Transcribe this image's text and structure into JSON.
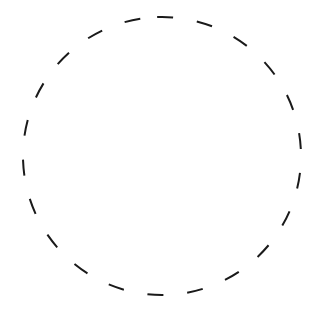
{
  "figure": {
    "shape": "dashed-circle",
    "center": [
      162,
      156
    ],
    "radius": 139,
    "stroke_color": "#1a1a1a",
    "background": "#ffffff",
    "stroke_width": 2,
    "dash": "16 24"
  }
}
